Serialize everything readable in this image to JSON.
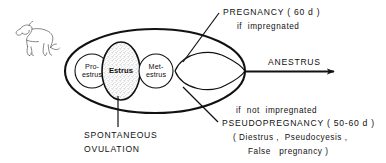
{
  "figure": {
    "type": "cycle-diagram",
    "background_color": "#ffffff",
    "ink_color": "#111111",
    "stipple_color": "#c9c9c9"
  },
  "animal_icon": {
    "name": "dog-line-drawing",
    "label": "dog"
  },
  "stages": [
    {
      "id": "proestrus",
      "line1": "Pro-",
      "line2": "estrus",
      "bold": false,
      "shaded": false
    },
    {
      "id": "estrus",
      "line1": "Estrus",
      "line2": "",
      "bold": true,
      "shaded": true
    },
    {
      "id": "metestrus",
      "line1": "Met-",
      "line2": "estrus",
      "bold": false,
      "shaded": false
    }
  ],
  "annotations": {
    "pregnancy": {
      "title": "PREGNANCY ( 60 d )",
      "condition": "if  impregnated"
    },
    "anestrus": {
      "label": "ANESTRUS"
    },
    "pseudopregnancy": {
      "condition": "if  not  impregnated",
      "title": "PSEUDOPREGNANCY ( 50-60 d )",
      "synonyms_line1": "( Diestrus ,  Pseudocyesis ,",
      "synonyms_line2": "False   pregnancy )"
    },
    "ovulation": {
      "line1": "SPONTANEOUS",
      "line2": "OVULATION"
    }
  }
}
